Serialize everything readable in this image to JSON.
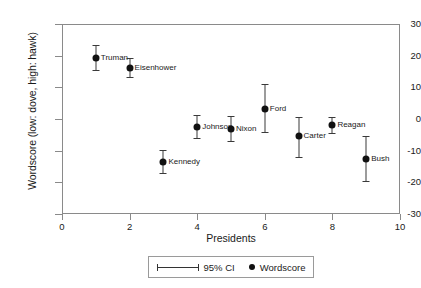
{
  "chart_data": {
    "type": "scatter",
    "title": "",
    "xlabel": "Presidents",
    "ylabel": "Wordscore (low: dove, high: hawk)",
    "xlim": [
      0,
      10
    ],
    "ylim": [
      -30,
      30
    ],
    "xticks": [
      0,
      2,
      4,
      6,
      8,
      10
    ],
    "yticks": [
      30,
      20,
      10,
      0,
      -10,
      -20,
      -30
    ],
    "grid": false,
    "legend_position": "below-axis",
    "legend": [
      {
        "key": "ci",
        "label": "95% CI",
        "marker": "error-bar"
      },
      {
        "key": "point",
        "label": "Wordscore",
        "marker": "filled-circle"
      }
    ],
    "categories": [
      "Truman",
      "Eisenhower",
      "Kennedy",
      "Johnson",
      "Nixon",
      "Ford",
      "Carter",
      "Reagan",
      "Bush"
    ],
    "x": [
      1,
      2,
      3,
      4,
      5,
      6,
      7,
      8,
      9
    ],
    "values": [
      19.3,
      16.1,
      -13.5,
      -2.5,
      -3.0,
      3.3,
      -5.5,
      -2.0,
      -12.5
    ],
    "ci_low": [
      15.5,
      13.3,
      -17.0,
      -6.0,
      -6.8,
      -4.0,
      -12.0,
      -4.5,
      -19.5
    ],
    "ci_high": [
      23.5,
      19.2,
      -9.7,
      1.2,
      0.8,
      11.0,
      0.5,
      0.5,
      -5.5
    ],
    "points": [
      {
        "name": "Truman",
        "x": 1,
        "y": 19.3,
        "ci_low": 15.5,
        "ci_high": 23.5,
        "label_side": "right"
      },
      {
        "name": "Eisenhower",
        "x": 2,
        "y": 16.1,
        "ci_low": 13.3,
        "ci_high": 19.2,
        "label_side": "right"
      },
      {
        "name": "Kennedy",
        "x": 3,
        "y": -13.5,
        "ci_low": -17.0,
        "ci_high": -9.7,
        "label_side": "right"
      },
      {
        "name": "Johnson",
        "x": 4,
        "y": -2.5,
        "ci_low": -6.0,
        "ci_high": 1.2,
        "label_side": "right"
      },
      {
        "name": "Nixon",
        "x": 5,
        "y": -3.0,
        "ci_low": -6.8,
        "ci_high": 0.8,
        "label_side": "right"
      },
      {
        "name": "Ford",
        "x": 6,
        "y": 3.3,
        "ci_low": -4.0,
        "ci_high": 11.0,
        "label_side": "right"
      },
      {
        "name": "Carter",
        "x": 7,
        "y": -5.5,
        "ci_low": -12.0,
        "ci_high": 0.5,
        "label_side": "right"
      },
      {
        "name": "Reagan",
        "x": 8,
        "y": -2.0,
        "ci_low": -4.5,
        "ci_high": 0.5,
        "label_side": "right"
      },
      {
        "name": "Bush",
        "x": 9,
        "y": -12.5,
        "ci_low": -19.5,
        "ci_high": -5.5,
        "label_side": "right"
      }
    ],
    "colors": {
      "marker": "#111111",
      "error_bar": "#3a3a3a",
      "axis": "#8a8a8a",
      "text": "#1a1a1a",
      "background": "#ffffff"
    }
  }
}
